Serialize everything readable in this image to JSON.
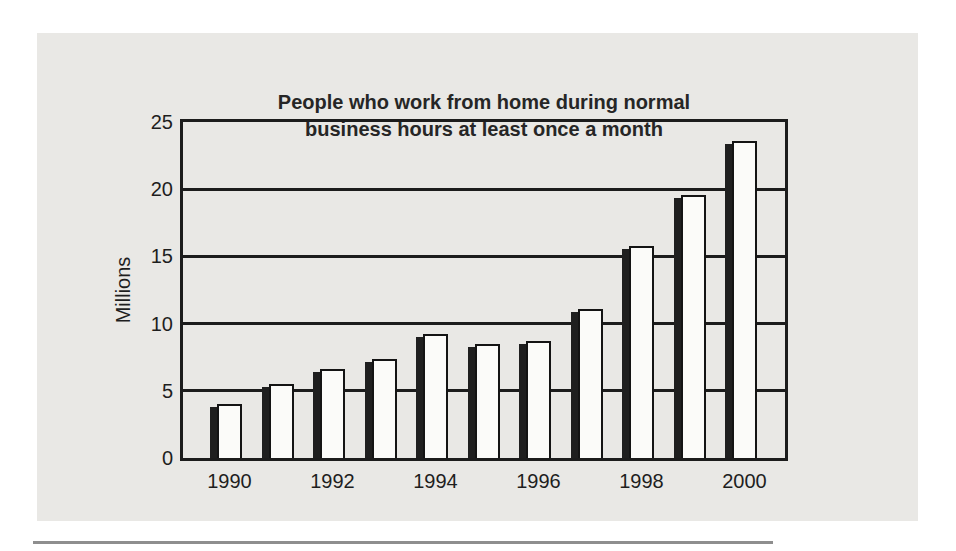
{
  "panel": {
    "background": "#e9e8e5"
  },
  "chart_data": {
    "type": "bar",
    "title_lines": [
      "People who work from home during normal",
      "business hours at least once a month"
    ],
    "title": "People who work from home during normal business hours at least once a month",
    "xlabel": "",
    "ylabel": "Millions",
    "categories": [
      1990,
      1991,
      1992,
      1993,
      1994,
      1995,
      1996,
      1997,
      1998,
      1999,
      2000
    ],
    "values": [
      4.0,
      5.5,
      6.6,
      7.4,
      9.2,
      8.5,
      8.7,
      11.1,
      15.8,
      19.6,
      23.6
    ],
    "x_tick_labels": [
      "1990",
      "1992",
      "1994",
      "1996",
      "1998",
      "2000"
    ],
    "y_ticks": [
      0,
      5,
      10,
      15,
      20,
      25
    ],
    "ylim": [
      0,
      25
    ],
    "grid": "horizontal",
    "legend": "none",
    "bar_fill": "#fbfbf9",
    "bar_border": "#141414",
    "bar_shadow_color": "#1f1f1f",
    "axis_color": "#1c1c1c",
    "panel_color": "#e9e8e5",
    "rule_color": "#8e8e8e"
  }
}
